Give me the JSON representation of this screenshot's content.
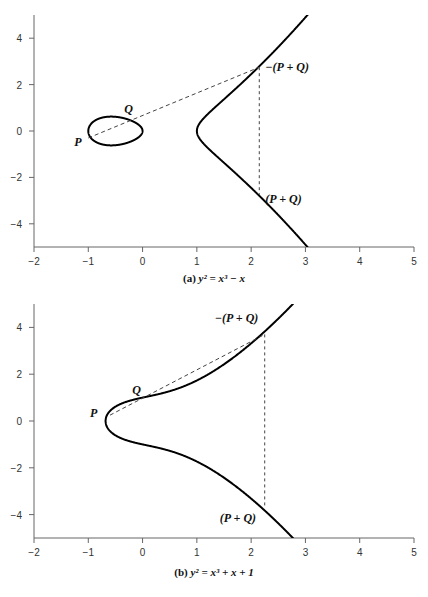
{
  "chart_data": [
    {
      "type": "line",
      "title": "(a) y² = x³ − x",
      "caption_prefix": "(a) ",
      "equation": "y² = x³ − x",
      "xlabel": "",
      "ylabel": "",
      "xlim": [
        -2,
        5
      ],
      "ylim": [
        -5,
        5
      ],
      "xticks": [
        "−2",
        "−1",
        "0",
        "1",
        "2",
        "3",
        "4",
        "5"
      ],
      "yticks": [
        "4",
        "2",
        "0",
        "−2",
        "−4"
      ],
      "grid": false,
      "curve": "y^2 = x^3 - x",
      "points": {
        "P": {
          "label": "P",
          "x": -1.0,
          "y": -0.3
        },
        "Q": {
          "label": "Q",
          "x": -0.3,
          "y": 0.52
        },
        "neg_sum": {
          "label": "−(P + Q)",
          "x": 2.15,
          "y": 2.75
        },
        "sum": {
          "label": "(P + Q)",
          "x": 2.15,
          "y": -2.75
        }
      },
      "lines": [
        "dashed secant through P and Q to −(P+Q)",
        "dashed vertical from −(P+Q) to (P+Q)"
      ]
    },
    {
      "type": "line",
      "title": "(b) y² = x³ + x + 1",
      "caption_prefix": "(b) ",
      "equation": "y² = x³ + x + 1",
      "xlabel": "",
      "ylabel": "",
      "xlim": [
        -2,
        5
      ],
      "ylim": [
        -5,
        5
      ],
      "xticks": [
        "−2",
        "−1",
        "0",
        "1",
        "2",
        "3",
        "4",
        "5"
      ],
      "yticks": [
        "4",
        "2",
        "0",
        "−2",
        "−4"
      ],
      "grid": false,
      "curve": "y^2 = x^3 + x + 1",
      "points": {
        "P": {
          "label": "P",
          "x": -0.6,
          "y": 0.25
        },
        "Q": {
          "label": "Q",
          "x": -0.1,
          "y": 0.9
        },
        "neg_sum": {
          "label": "−(P + Q)",
          "x": 2.25,
          "y": 3.7
        },
        "sum": {
          "label": "(P + Q)",
          "x": 2.25,
          "y": -3.7
        }
      },
      "lines": [
        "dashed secant through P and Q to −(P+Q)",
        "dashed vertical from −(P+Q) to (P+Q)"
      ]
    }
  ]
}
